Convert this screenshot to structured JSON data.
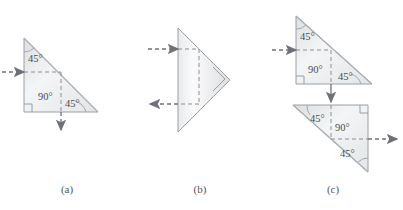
{
  "figure": {
    "background_color": "#ffffff",
    "ray_color": "#6e7278",
    "outline_color": "#9aa0a6",
    "fill_light": "#f2f3f4",
    "fill_dark": "#d9dbdd",
    "label_color": "#4c4d51"
  },
  "panels": [
    {
      "id": "a",
      "caption": "(a)",
      "prism": {
        "shape": "right-triangle",
        "orientation": "right-angle-bottom-left, hypotenuse from top-left to bottom-right"
      },
      "angles": [
        {
          "value": "45°",
          "position": "upper-left-vertex"
        },
        {
          "value": "90°",
          "position": "interior-center"
        },
        {
          "value": "45°",
          "position": "lower-right-of-interior"
        }
      ],
      "rays": [
        {
          "name": "incoming-ray",
          "direction": "right",
          "style": "dashed-with-arrow",
          "enters": "left-vertical-face"
        },
        {
          "name": "outgoing-ray",
          "direction": "down",
          "style": "dashed-with-arrow",
          "exits": "bottom-horizontal-face"
        }
      ],
      "right_angle_marks": 1
    },
    {
      "id": "b",
      "caption": "(b)",
      "prism": {
        "shape": "right-triangle",
        "orientation": "right-angle at right apex, vertical face on left"
      },
      "angles": [],
      "rays": [
        {
          "name": "incoming-ray",
          "direction": "right",
          "style": "dashed-with-arrow",
          "enters": "left-vertical-face-upper"
        },
        {
          "name": "outgoing-ray",
          "direction": "left",
          "style": "dashed-with-arrow",
          "exits": "left-vertical-face-lower"
        }
      ],
      "right_angle_marks": 1
    },
    {
      "id": "c",
      "caption": "(c)",
      "prisms": [
        {
          "name": "upper-prism",
          "shape": "right-triangle",
          "orientation": "right-angle-bottom-left, hypotenuse from top-left to bottom-right",
          "angles": [
            {
              "value": "45°",
              "position": "upper-left-vertex"
            },
            {
              "value": "90°",
              "position": "interior-center"
            },
            {
              "value": "45°",
              "position": "lower-right-of-interior"
            }
          ],
          "right_angle_marks": 1
        },
        {
          "name": "lower-prism",
          "shape": "right-triangle",
          "orientation": "right-angle-top-right, hypotenuse from top-left to bottom-right",
          "angles": [
            {
              "value": "45°",
              "position": "upper-left-vertex"
            },
            {
              "value": "90°",
              "position": "interior-center"
            },
            {
              "value": "45°",
              "position": "lower-right-of-interior"
            }
          ],
          "right_angle_marks": 1
        }
      ],
      "rays": [
        {
          "name": "incoming-ray",
          "direction": "right",
          "style": "dashed-with-arrow",
          "enters": "upper-prism-left-face"
        },
        {
          "name": "transfer-ray",
          "direction": "down",
          "style": "solid-with-arrow",
          "between": "upper-prism-bottom to lower-prism-top"
        },
        {
          "name": "outgoing-ray",
          "direction": "right",
          "style": "dashed-with-arrow",
          "exits": "lower-prism-right-face"
        }
      ]
    }
  ]
}
